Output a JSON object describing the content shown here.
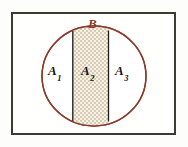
{
  "figure": {
    "title_visible": false,
    "background_color": "#fdfdfb",
    "frame": {
      "border_color": "#3c3a32",
      "fill_color": "#fffffd"
    },
    "set_b": {
      "label": "B",
      "shape": "ellipse",
      "stroke_color": "#8d3a2c",
      "fill_color": "#ffffff"
    },
    "band": {
      "fill_pattern": "stipple-dots",
      "pattern_color": "#cdbfa8",
      "pattern_background": "#f6f1e6",
      "divider_color": "#1a1a1a"
    },
    "regions": [
      {
        "label_main": "A",
        "label_sub": "1",
        "name": "region-a1"
      },
      {
        "label_main": "A",
        "label_sub": "2",
        "name": "region-a2"
      },
      {
        "label_main": "A",
        "label_sub": "3",
        "name": "region-a3"
      }
    ]
  }
}
